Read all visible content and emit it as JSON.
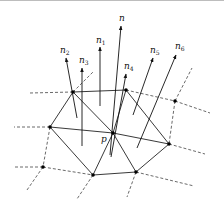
{
  "diagram": {
    "colors": {
      "line": "#222222",
      "dashed": "#444444",
      "vertex": "#000000",
      "topbar": "#bdbdbd"
    },
    "center_label": "p",
    "vertices": [
      {
        "id": "p",
        "x": 113,
        "y": 133
      },
      {
        "id": "a",
        "x": 73,
        "y": 92
      },
      {
        "id": "b",
        "x": 126,
        "y": 90
      },
      {
        "id": "c",
        "x": 50,
        "y": 127
      },
      {
        "id": "e",
        "x": 93,
        "y": 175
      },
      {
        "id": "g",
        "x": 136,
        "y": 172
      },
      {
        "id": "f",
        "x": 169,
        "y": 144
      },
      {
        "id": "d",
        "x": 43,
        "y": 167
      },
      {
        "id": "h",
        "x": 175,
        "y": 101
      }
    ],
    "normals": [
      {
        "name": "n",
        "base": "n",
        "sub": "",
        "x1": 110,
        "y1": 155,
        "x2": 121,
        "y2": 26,
        "lx": 119,
        "ly": 21
      },
      {
        "name": "n1",
        "base": "n",
        "sub": "1",
        "x1": 100,
        "y1": 106,
        "x2": 100,
        "y2": 47,
        "lx": 96,
        "ly": 43
      },
      {
        "name": "n2",
        "base": "n",
        "sub": "2",
        "x1": 77,
        "y1": 118,
        "x2": 66,
        "y2": 58,
        "lx": 60,
        "ly": 53
      },
      {
        "name": "n3",
        "base": "n",
        "sub": "3",
        "x1": 82,
        "y1": 146,
        "x2": 82,
        "y2": 68,
        "lx": 79,
        "ly": 63
      },
      {
        "name": "n4",
        "base": "n",
        "sub": "4",
        "x1": 111,
        "y1": 157,
        "x2": 126,
        "y2": 74,
        "lx": 124,
        "ly": 69
      },
      {
        "name": "n5",
        "base": "n",
        "sub": "5",
        "x1": 133,
        "y1": 115,
        "x2": 153,
        "y2": 58,
        "lx": 150,
        "ly": 53
      },
      {
        "name": "n6",
        "base": "n",
        "sub": "6",
        "x1": 137,
        "y1": 148,
        "x2": 176,
        "y2": 55,
        "lx": 175,
        "ly": 49
      }
    ]
  }
}
